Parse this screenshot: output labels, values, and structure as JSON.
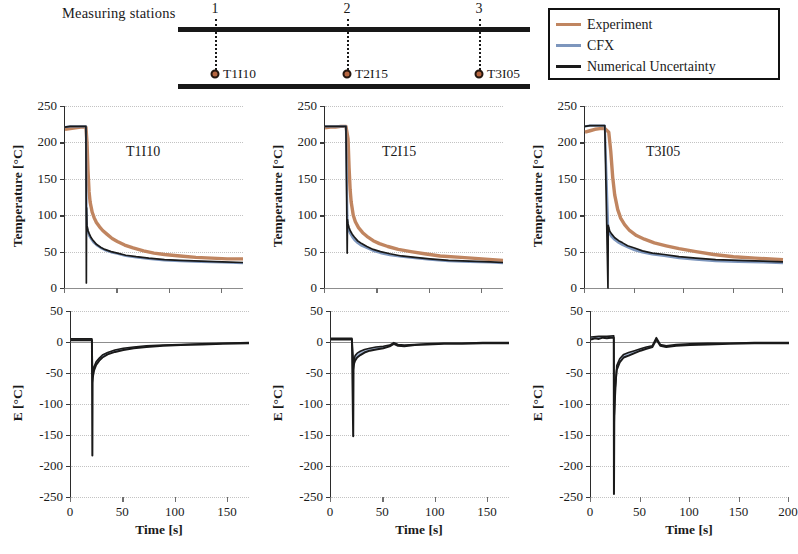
{
  "schematic": {
    "title": "Measuring stations",
    "stations": [
      {
        "number": "1",
        "label": "T1I10"
      },
      {
        "number": "2",
        "label": "T2I15"
      },
      {
        "number": "3",
        "label": "T3I05"
      }
    ]
  },
  "legend": {
    "items": [
      {
        "label": "Experiment",
        "color": "#c08560"
      },
      {
        "label": "CFX",
        "color": "#7d96bd"
      },
      {
        "label": "Numerical Uncertainty",
        "color": "#1a1a1a"
      }
    ]
  },
  "colors": {
    "experiment": "#c08560",
    "cfx": "#7d96bd",
    "uncertainty": "#1a1a1a",
    "grid": "#c3c3c3",
    "axis": "#2b2b2b"
  },
  "chart_data": [
    {
      "type": "line",
      "panel": "T1I10",
      "title": "T1I10",
      "xlabel": "Time [s]",
      "ylabel": "Temperature [°C]",
      "xlim": [
        0,
        170
      ],
      "ylim": [
        0,
        250
      ],
      "xticks": [
        0,
        50,
        100,
        150
      ],
      "yticks": [
        0,
        50,
        100,
        150,
        200,
        250
      ],
      "grid": true,
      "legend_position": "external-top-right",
      "series": [
        {
          "name": "Experiment",
          "x": [
            0,
            5,
            10,
            15,
            19,
            20,
            21,
            22,
            23,
            24,
            26,
            28,
            30,
            33,
            36,
            40,
            45,
            50,
            57,
            65,
            75,
            85,
            95,
            110,
            125,
            140,
            155,
            170
          ],
          "values": [
            218,
            219,
            220,
            221,
            221,
            221,
            200,
            160,
            132,
            118,
            104,
            96,
            90,
            84,
            79,
            74,
            68,
            64,
            59,
            55,
            51,
            48,
            46,
            44,
            42,
            41,
            40,
            40
          ]
        },
        {
          "name": "CFX",
          "x": [
            0,
            5,
            10,
            15,
            19,
            20,
            20.6,
            21,
            22,
            23,
            25,
            27,
            30,
            34,
            38,
            44,
            50,
            58,
            68,
            80,
            95,
            110,
            130,
            150,
            170
          ],
          "values": [
            221,
            222,
            222,
            222,
            222,
            222,
            105,
            82,
            76,
            72,
            67,
            63,
            59,
            55,
            52,
            49,
            47,
            44,
            42,
            40,
            38,
            37,
            36,
            35,
            34
          ]
        },
        {
          "name": "Numerical Uncertainty",
          "x": [
            0,
            5,
            10,
            15,
            19,
            20,
            20.4,
            20.6,
            21,
            22,
            23,
            25,
            27,
            30,
            34,
            38,
            44,
            50,
            58,
            68,
            80,
            95,
            110,
            130,
            150,
            170
          ],
          "values": [
            221,
            222,
            222,
            222,
            222,
            222,
            7,
            110,
            86,
            79,
            75,
            69,
            65,
            60,
            56,
            53,
            50,
            48,
            45,
            43,
            41,
            39,
            38,
            37,
            36,
            35
          ]
        }
      ]
    },
    {
      "type": "line",
      "panel": "T2I15",
      "title": "T2I15",
      "xlabel": "Time [s]",
      "ylabel": "Temperature [°C]",
      "xlim": [
        0,
        170
      ],
      "ylim": [
        0,
        250
      ],
      "xticks": [
        0,
        50,
        100,
        150
      ],
      "yticks": [
        0,
        50,
        100,
        150,
        200,
        250
      ],
      "grid": true,
      "series": [
        {
          "name": "Experiment",
          "x": [
            0,
            5,
            10,
            15,
            20,
            22,
            23,
            24,
            25,
            27,
            29,
            32,
            36,
            40,
            46,
            52,
            60,
            70,
            82,
            95,
            110,
            130,
            150,
            170
          ],
          "values": [
            220,
            221,
            221,
            222,
            222,
            205,
            165,
            135,
            118,
            100,
            91,
            83,
            76,
            71,
            65,
            61,
            57,
            53,
            50,
            47,
            44,
            42,
            40,
            38
          ]
        },
        {
          "name": "CFX",
          "x": [
            0,
            5,
            10,
            15,
            20,
            21.5,
            22,
            23,
            24,
            26,
            28,
            31,
            35,
            40,
            46,
            53,
            62,
            73,
            86,
            100,
            118,
            138,
            158,
            170
          ],
          "values": [
            222,
            222,
            222,
            222,
            222,
            88,
            82,
            78,
            75,
            70,
            66,
            62,
            58,
            55,
            51,
            48,
            45,
            43,
            41,
            39,
            37,
            36,
            35,
            34
          ]
        },
        {
          "name": "Numerical Uncertainty",
          "x": [
            0,
            5,
            10,
            15,
            20,
            21.2,
            21.5,
            22,
            23,
            24,
            26,
            28,
            31,
            35,
            40,
            46,
            53,
            62,
            73,
            86,
            100,
            118,
            138,
            158,
            170
          ],
          "values": [
            222,
            222,
            222,
            222,
            222,
            48,
            94,
            88,
            83,
            79,
            74,
            70,
            65,
            61,
            57,
            53,
            50,
            47,
            44,
            42,
            40,
            38,
            37,
            36,
            35
          ]
        }
      ]
    },
    {
      "type": "line",
      "panel": "T3I05",
      "title": "T3I05",
      "xlabel": "Time [s]",
      "ylabel": "Temperature [°C]",
      "xlim": [
        0,
        200
      ],
      "ylim": [
        0,
        250
      ],
      "xticks": [
        0,
        50,
        100,
        150,
        200
      ],
      "yticks": [
        0,
        50,
        100,
        150,
        200,
        250
      ],
      "grid": true,
      "series": [
        {
          "name": "Experiment",
          "x": [
            0,
            5,
            10,
            15,
            20,
            24,
            26,
            28,
            30,
            33,
            36,
            40,
            45,
            52,
            60,
            70,
            82,
            95,
            112,
            130,
            150,
            172,
            200
          ],
          "values": [
            214,
            216,
            218,
            219,
            219,
            214,
            188,
            152,
            128,
            108,
            96,
            87,
            79,
            72,
            67,
            62,
            58,
            54,
            50,
            46,
            43,
            41,
            39
          ]
        },
        {
          "name": "CFX",
          "x": [
            0,
            5,
            10,
            15,
            20,
            23.5,
            24,
            25,
            27,
            30,
            34,
            38,
            43,
            50,
            58,
            68,
            80,
            95,
            112,
            132,
            155,
            180,
            200
          ],
          "values": [
            222,
            223,
            223,
            223,
            223,
            80,
            78,
            74,
            70,
            66,
            62,
            59,
            56,
            52,
            49,
            46,
            44,
            41,
            39,
            37,
            36,
            35,
            34
          ]
        },
        {
          "name": "Numerical Uncertainty",
          "x": [
            0,
            5,
            10,
            15,
            20,
            23.2,
            23.5,
            24,
            25,
            27,
            30,
            34,
            38,
            43,
            50,
            58,
            68,
            80,
            95,
            112,
            132,
            155,
            180,
            200
          ],
          "values": [
            222,
            223,
            223,
            223,
            223,
            0,
            86,
            83,
            78,
            74,
            69,
            65,
            62,
            58,
            55,
            51,
            48,
            46,
            43,
            41,
            39,
            38,
            37,
            36
          ]
        }
      ]
    },
    {
      "type": "line",
      "panel": "E-T1I10",
      "title": "",
      "xlabel": "Time [s]",
      "ylabel": "E [°C]",
      "xlim": [
        0,
        170
      ],
      "ylim": [
        -250,
        50
      ],
      "xticks": [
        0,
        50,
        100,
        150
      ],
      "yticks": [
        -250,
        -200,
        -150,
        -100,
        -50,
        0,
        50
      ],
      "grid": true,
      "series": [
        {
          "name": "Error CFX",
          "x": [
            0,
            5,
            10,
            15,
            19,
            20,
            20.4,
            20.6,
            21,
            22,
            24,
            27,
            30,
            35,
            42,
            50,
            60,
            72,
            88,
            105,
            125,
            145,
            170
          ],
          "values": [
            3,
            3,
            3,
            3,
            3,
            3,
            -183,
            -66,
            -55,
            -46,
            -37,
            -30,
            -25,
            -20,
            -16,
            -13,
            -10,
            -8,
            -6,
            -5,
            -4,
            -3,
            -2
          ]
        },
        {
          "name": "Error band upper",
          "x": [
            0,
            10,
            19,
            20,
            20.6,
            22,
            24,
            27,
            30,
            35,
            42,
            50,
            60,
            72,
            88,
            105,
            125,
            145,
            170
          ],
          "values": [
            5,
            5,
            5,
            5,
            -52,
            -40,
            -32,
            -26,
            -21,
            -17,
            -13,
            -10,
            -8,
            -6,
            -5,
            -4,
            -3,
            -2,
            -1
          ]
        }
      ]
    },
    {
      "type": "line",
      "panel": "E-T2I15",
      "title": "",
      "xlabel": "Time [s]",
      "ylabel": "E [°C]",
      "xlim": [
        0,
        170
      ],
      "ylim": [
        -250,
        50
      ],
      "xticks": [
        0,
        50,
        100,
        150
      ],
      "yticks": [
        -250,
        -200,
        -150,
        -100,
        -50,
        0,
        50
      ],
      "grid": true,
      "series": [
        {
          "name": "Error CFX",
          "x": [
            0,
            5,
            10,
            15,
            20,
            21.2,
            21.5,
            22,
            23,
            25,
            28,
            32,
            37,
            43,
            50,
            56,
            60,
            64,
            70,
            80,
            92,
            108,
            125,
            145,
            170
          ],
          "values": [
            4,
            4,
            4,
            4,
            4,
            -152,
            -45,
            -35,
            -30,
            -25,
            -21,
            -17,
            -14,
            -12,
            -10,
            -7,
            -3,
            -6,
            -7,
            -5,
            -4,
            -3,
            -3,
            -2,
            -2
          ]
        },
        {
          "name": "Error band upper",
          "x": [
            0,
            10,
            20,
            21.5,
            23,
            25,
            28,
            32,
            37,
            43,
            50,
            56,
            60,
            64,
            70,
            80,
            92,
            108,
            125,
            145,
            170
          ],
          "values": [
            6,
            6,
            6,
            -33,
            -22,
            -18,
            -15,
            -12,
            -10,
            -8,
            -7,
            -5,
            -1,
            -4,
            -5,
            -4,
            -3,
            -2,
            -2,
            -1,
            -1
          ]
        }
      ]
    },
    {
      "type": "line",
      "panel": "E-T3I05",
      "title": "",
      "xlabel": "Time [s]",
      "ylabel": "E [°C]",
      "xlim": [
        0,
        200
      ],
      "ylim": [
        -250,
        50
      ],
      "xticks": [
        0,
        50,
        100,
        150,
        200
      ],
      "yticks": [
        -250,
        -200,
        -150,
        -100,
        -50,
        0,
        50
      ],
      "grid": true,
      "series": [
        {
          "name": "Error CFX",
          "x": [
            0,
            4,
            8,
            12,
            16,
            20,
            23,
            23.2,
            23.5,
            24,
            26,
            29,
            33,
            38,
            44,
            50,
            56,
            62,
            66,
            70,
            76,
            86,
            100,
            118,
            140,
            165,
            200
          ],
          "values": [
            4,
            6,
            5,
            7,
            6,
            7,
            7,
            -245,
            -130,
            -78,
            -45,
            -33,
            -25,
            -22,
            -18,
            -14,
            -11,
            -8,
            4,
            -6,
            -8,
            -6,
            -5,
            -4,
            -3,
            -2,
            -2
          ]
        },
        {
          "name": "Error band upper",
          "x": [
            0,
            8,
            16,
            23,
            23.5,
            26,
            29,
            33,
            38,
            44,
            50,
            56,
            62,
            66,
            70,
            76,
            86,
            100,
            118,
            140,
            165,
            200
          ],
          "values": [
            8,
            9,
            9,
            10,
            -118,
            -38,
            -27,
            -20,
            -17,
            -14,
            -11,
            -8,
            -6,
            7,
            -4,
            -6,
            -4,
            -3,
            -2,
            -2,
            -1,
            -1
          ]
        }
      ]
    }
  ]
}
